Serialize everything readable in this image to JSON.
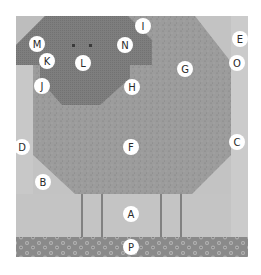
{
  "diagram": {
    "colors": {
      "background": "#c4c4c4",
      "side_strip": "#c9c9c9",
      "body": "#9a9a9a",
      "head": "#7b7b7b",
      "border_print": "#8c8c8c",
      "legs": "#555555",
      "eyes": "#3a3a3a"
    },
    "pieces": [
      {
        "id": "A",
        "label": "A",
        "region": "ground-between-legs"
      },
      {
        "id": "B",
        "label": "B",
        "region": "lower-left-corner-triangle"
      },
      {
        "id": "C",
        "label": "C",
        "region": "right-side-strip"
      },
      {
        "id": "D",
        "label": "D",
        "region": "left-side-strip"
      },
      {
        "id": "E",
        "label": "E",
        "region": "upper-right-corner"
      },
      {
        "id": "F",
        "label": "F",
        "region": "body-center"
      },
      {
        "id": "G",
        "label": "G",
        "region": "body-upper-right"
      },
      {
        "id": "H",
        "label": "H",
        "region": "body-beside-head"
      },
      {
        "id": "I",
        "label": "I",
        "region": "body-top"
      },
      {
        "id": "J",
        "label": "J",
        "region": "body-left-of-head"
      },
      {
        "id": "K",
        "label": "K",
        "region": "left-ear-lower"
      },
      {
        "id": "L",
        "label": "L",
        "region": "face"
      },
      {
        "id": "M",
        "label": "M",
        "region": "left-ear"
      },
      {
        "id": "N",
        "label": "N",
        "region": "right-ear"
      },
      {
        "id": "O",
        "label": "O",
        "region": "right-corner-notch"
      },
      {
        "id": "P",
        "label": "P",
        "region": "bottom-border-print"
      }
    ]
  }
}
